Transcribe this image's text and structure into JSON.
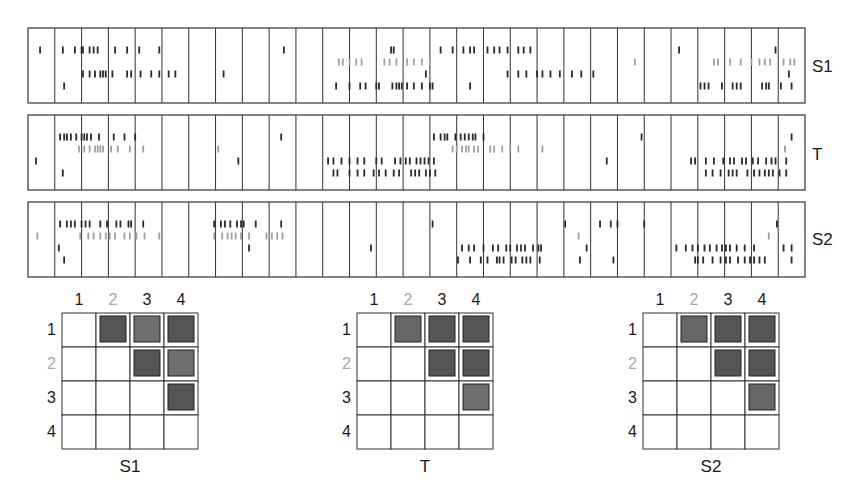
{
  "figure": {
    "neuron_colors": {
      "1": "#2a2a2a",
      "2": "#a0a0a0",
      "3": "#2a2a2a",
      "4": "#2a2a2a"
    },
    "trials_per_panel": 29
  },
  "panels": [
    {
      "label": "S1",
      "spikes": {
        "1": [
          0.45,
          1.3,
          1.75,
          2.0,
          2.05,
          2.3,
          2.45,
          2.6,
          3.25,
          3.7,
          4.15,
          4.9,
          9.55,
          13.55,
          13.65,
          15.4,
          15.85,
          16.25,
          16.5,
          16.65,
          17.15,
          17.4,
          17.6,
          17.9,
          18.3,
          18.5,
          18.75,
          24.3,
          27.9
        ],
        "2": [
          11.6,
          11.75,
          12.0,
          12.25,
          12.45,
          13.3,
          13.5,
          13.75,
          14.15,
          14.4,
          14.7,
          15.0,
          22.65,
          25.6,
          25.75,
          26.2,
          26.6,
          27.0,
          27.3,
          27.5,
          27.7,
          28.2,
          28.45,
          28.6
        ],
        "3": [
          2.05,
          2.3,
          2.5,
          2.7,
          2.8,
          2.9,
          3.15,
          3.7,
          3.85,
          4.2,
          4.6,
          4.9,
          5.25,
          5.5,
          7.3,
          14.85,
          17.9,
          18.3,
          18.6,
          19.0,
          19.2,
          19.5,
          19.85,
          20.3,
          20.65,
          21.1,
          28.4
        ],
        "4": [
          1.35,
          11.5,
          12.0,
          12.4,
          12.6,
          13.0,
          13.1,
          13.6,
          13.75,
          13.85,
          13.95,
          14.15,
          14.4,
          14.7,
          15.0,
          15.1,
          16.5,
          25.1,
          25.25,
          25.4,
          25.9,
          26.3,
          26.45,
          26.6,
          27.4,
          27.55,
          27.65,
          28.1,
          28.5
        ]
      }
    },
    {
      "label": "T",
      "spikes": {
        "1": [
          1.2,
          1.35,
          1.45,
          1.6,
          1.8,
          2.0,
          2.1,
          2.2,
          2.35,
          2.65,
          3.2,
          3.6,
          4.0,
          9.45,
          15.15,
          15.4,
          15.55,
          15.65,
          15.95,
          16.15,
          16.3,
          16.45,
          16.6,
          16.7,
          17.0,
          22.9,
          28.5
        ],
        "2": [
          1.9,
          2.1,
          2.3,
          2.5,
          2.6,
          2.7,
          2.8,
          3.1,
          3.35,
          3.8,
          4.3,
          7.1,
          15.85,
          16.0,
          16.2,
          16.35,
          16.45,
          16.65,
          16.8,
          17.25,
          17.4,
          17.7,
          18.0,
          18.3,
          19.2,
          28.25
        ],
        "3": [
          0.3,
          7.85,
          11.2,
          11.4,
          11.7,
          12.0,
          12.3,
          12.55,
          13.0,
          13.2,
          13.7,
          13.9,
          14.1,
          14.25,
          14.5,
          14.65,
          14.8,
          14.95,
          15.15,
          21.6,
          24.75,
          24.9,
          25.3,
          25.6,
          25.95,
          26.2,
          26.35,
          26.65,
          26.8,
          27.05,
          27.25,
          27.55,
          27.75,
          27.9,
          28.3
        ],
        "4": [
          1.3,
          11.4,
          11.55,
          12.0,
          12.3,
          12.55,
          12.9,
          13.1,
          13.35,
          13.65,
          13.85,
          14.3,
          14.45,
          14.6,
          14.85,
          15.0,
          15.2,
          25.3,
          25.55,
          25.85,
          26.15,
          26.3,
          26.45,
          26.85,
          27.1,
          27.3,
          27.5,
          27.65,
          27.8,
          28.05,
          28.3
        ]
      }
    },
    {
      "label": "S2",
      "spikes": {
        "1": [
          1.2,
          1.45,
          1.6,
          1.75,
          2.0,
          2.15,
          2.3,
          2.7,
          2.95,
          3.3,
          3.45,
          3.75,
          3.85,
          4.3,
          6.95,
          7.2,
          7.35,
          7.55,
          7.8,
          7.95,
          8.05,
          8.5,
          9.45,
          15.1,
          20.05,
          21.35,
          21.75,
          22.0,
          23.0,
          27.95
        ],
        "2": [
          0.35,
          1.95,
          2.25,
          2.45,
          2.7,
          2.9,
          3.05,
          3.25,
          3.6,
          3.8,
          4.05,
          4.35,
          4.9,
          6.95,
          7.25,
          7.45,
          7.6,
          7.75,
          7.95,
          8.25,
          8.9,
          9.1,
          9.3,
          9.5,
          20.55,
          27.65
        ],
        "3": [
          1.15,
          8.25,
          12.8,
          16.2,
          16.45,
          16.65,
          17.0,
          17.35,
          17.55,
          17.85,
          18.0,
          18.25,
          18.4,
          18.55,
          18.85,
          19.05,
          19.15,
          20.85,
          24.2,
          24.55,
          24.8,
          25.0,
          25.25,
          25.45,
          25.7,
          25.9,
          26.05,
          26.2,
          26.45,
          26.75,
          27.1,
          28.2,
          28.5
        ],
        "4": [
          1.35,
          16.05,
          16.5,
          16.9,
          17.15,
          17.5,
          17.6,
          17.75,
          18.05,
          18.2,
          18.45,
          18.6,
          18.75,
          19.1,
          20.6,
          21.85,
          24.9,
          25.0,
          25.2,
          25.55,
          25.85,
          26.05,
          26.2,
          26.5,
          26.75,
          26.95,
          27.1,
          27.3,
          27.5,
          28.5
        ]
      }
    }
  ],
  "matrices": [
    {
      "title": "S1",
      "col_labels": [
        "1",
        "2",
        "3",
        "4"
      ],
      "row_labels": [
        "1",
        "2",
        "3",
        "4"
      ],
      "gray_index": 1,
      "filled": [
        [
          0,
          1
        ],
        [
          0,
          2
        ],
        [
          0,
          3
        ],
        [
          1,
          2
        ],
        [
          1,
          3
        ],
        [
          2,
          3
        ]
      ],
      "fill_shades": [
        "#555555",
        "#6e6e6e",
        "#555555",
        "#555555",
        "#6e6e6e",
        "#555555"
      ]
    },
    {
      "title": "T",
      "col_labels": [
        "1",
        "2",
        "3",
        "4"
      ],
      "row_labels": [
        "1",
        "2",
        "3",
        "4"
      ],
      "gray_index": 1,
      "filled": [
        [
          0,
          1
        ],
        [
          0,
          2
        ],
        [
          0,
          3
        ],
        [
          1,
          2
        ],
        [
          1,
          3
        ],
        [
          2,
          3
        ]
      ],
      "fill_shades": [
        "#666666",
        "#555555",
        "#555555",
        "#555555",
        "#555555",
        "#6e6e6e"
      ]
    },
    {
      "title": "S2",
      "col_labels": [
        "1",
        "2",
        "3",
        "4"
      ],
      "row_labels": [
        "1",
        "2",
        "3",
        "4"
      ],
      "gray_index": 1,
      "filled": [
        [
          0,
          1
        ],
        [
          0,
          2
        ],
        [
          0,
          3
        ],
        [
          1,
          2
        ],
        [
          1,
          3
        ],
        [
          2,
          3
        ]
      ],
      "fill_shades": [
        "#666666",
        "#555555",
        "#555555",
        "#555555",
        "#555555",
        "#666666"
      ]
    }
  ]
}
